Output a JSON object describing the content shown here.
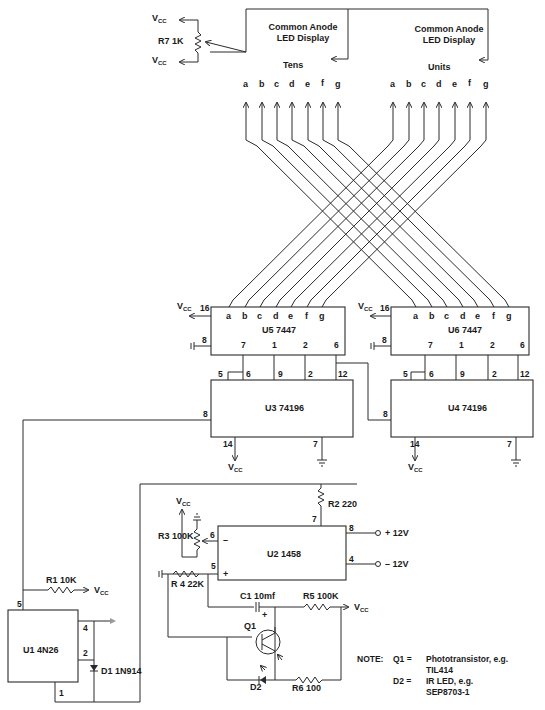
{
  "diagram": {
    "type": "circuit-schematic",
    "displays": {
      "tens": {
        "title_line1": "Common Anode",
        "title_line2": "LED Display",
        "label": "Tens"
      },
      "units": {
        "title_line1": "Common Anode",
        "title_line2": "LED Display",
        "label": "Units"
      },
      "segments": [
        "a",
        "b",
        "c",
        "d",
        "e",
        "f",
        "g"
      ]
    },
    "r7": {
      "label": "R7  1K",
      "vcc_top": "V",
      "vcc_bottom": "V",
      "vcc_sub": "CC"
    },
    "u5": {
      "label": "U5  7447",
      "pin_vcc": "16",
      "pin_gnd": "8",
      "bottom_pins": [
        "7",
        "1",
        "2",
        "6"
      ],
      "vcc": "V",
      "vcc_sub": "CC"
    },
    "u6": {
      "label": "U6  7447",
      "pin_vcc": "16",
      "pin_gnd": "8",
      "bottom_pins": [
        "7",
        "1",
        "2",
        "6"
      ],
      "vcc": "V",
      "vcc_sub": "CC"
    },
    "u3": {
      "label": "U3   74196",
      "top_pins": [
        "5",
        "6",
        "9",
        "2",
        "12"
      ],
      "pin_clk": "8",
      "pin_vcc": "14",
      "pin_gnd": "7",
      "vcc": "V",
      "vcc_sub": "CC"
    },
    "u4": {
      "label": "U4   74196",
      "top_pins": [
        "5",
        "6",
        "9",
        "2",
        "12"
      ],
      "pin_clk": "8",
      "pin_vcc": "14",
      "pin_gnd": "7",
      "vcc": "V",
      "vcc_sub": "CC"
    },
    "u2": {
      "label": "U2 1458",
      "pin6": "6",
      "pin5": "5",
      "pin7": "7",
      "pin8": "8",
      "pin4": "4",
      "minus": "–",
      "plus": "+"
    },
    "supply": {
      "pos": "+   12V",
      "neg": "–   12V"
    },
    "r2": {
      "label": "R2  220"
    },
    "r3": {
      "label": "R3  100K",
      "vcc": "V",
      "vcc_sub": "CC"
    },
    "r4": {
      "label": "R 4  22K"
    },
    "c1": {
      "label": "C1  10mf",
      "polarity": "+"
    },
    "r5": {
      "label": "R5  100K",
      "vcc": "V",
      "vcc_sub": "CC"
    },
    "q1": {
      "label": "Q1"
    },
    "d2": {
      "label": "D2"
    },
    "r6": {
      "label": "R6  100"
    },
    "r1": {
      "label": "R1  10K",
      "vcc": "V",
      "vcc_sub": "CC"
    },
    "u1": {
      "label": "U1  4N26",
      "pin5": "5",
      "pin4": "4",
      "pin2": "2",
      "pin1": "1"
    },
    "d1": {
      "label": "D1  1N914"
    },
    "note": {
      "title": "NOTE:",
      "rows": [
        {
          "key": "Q1  =",
          "value": "Phototransistor,   e.g."
        },
        {
          "key": "",
          "value": "TIL414"
        },
        {
          "key": "D2  =",
          "value": "IR  LED,  e.g."
        },
        {
          "key": "",
          "value": "SEP8703-1"
        }
      ]
    }
  }
}
